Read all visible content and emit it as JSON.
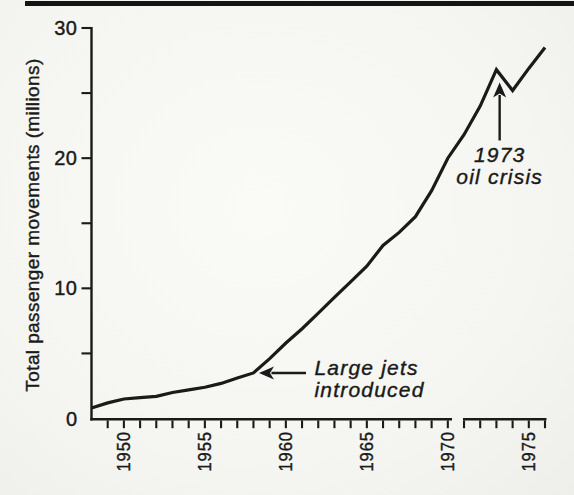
{
  "page": {
    "ink_color": "#1a1a1a",
    "paper_color": "#f5f5f1",
    "top_rule_color": "#141414"
  },
  "chart_data": {
    "type": "line",
    "title": "",
    "xlabel": "",
    "ylabel": "Total passenger movements (millions)",
    "x_range": [
      1948,
      1976
    ],
    "y_range": [
      0,
      30
    ],
    "x_labeled_ticks": [
      1950,
      1955,
      1960,
      1965,
      1970,
      1975
    ],
    "x_minor_tick_every": 1,
    "y_labeled_ticks": [
      0,
      10,
      20,
      30
    ],
    "y_minor_ticks": [
      5,
      15,
      25
    ],
    "grid": false,
    "legend_position": "none",
    "line_color": "#1a1a1a",
    "series": [
      {
        "name": "Total passenger movements",
        "points": [
          [
            1948,
            0.8
          ],
          [
            1949,
            1.2
          ],
          [
            1950,
            1.5
          ],
          [
            1951,
            1.6
          ],
          [
            1952,
            1.7
          ],
          [
            1953,
            2.0
          ],
          [
            1954,
            2.2
          ],
          [
            1955,
            2.4
          ],
          [
            1956,
            2.7
          ],
          [
            1957,
            3.1
          ],
          [
            1958,
            3.5
          ],
          [
            1959,
            4.6
          ],
          [
            1960,
            5.8
          ],
          [
            1961,
            6.9
          ],
          [
            1962,
            8.1
          ],
          [
            1963,
            9.3
          ],
          [
            1964,
            10.5
          ],
          [
            1965,
            11.7
          ],
          [
            1966,
            13.3
          ],
          [
            1967,
            14.3
          ],
          [
            1968,
            15.5
          ],
          [
            1969,
            17.5
          ],
          [
            1970,
            20.0
          ],
          [
            1971,
            21.8
          ],
          [
            1972,
            24.0
          ],
          [
            1973,
            26.8
          ],
          [
            1974,
            25.2
          ],
          [
            1975,
            26.9
          ],
          [
            1976,
            28.5
          ]
        ]
      }
    ],
    "annotations": [
      {
        "id": "large-jets-introduced",
        "lines": [
          "Large jets",
          "introduced"
        ],
        "arrow": "left",
        "target": {
          "year": 1958,
          "value": 3.5
        }
      },
      {
        "id": "oil-crisis-1973",
        "lines": [
          "1973",
          "oil crisis"
        ],
        "arrow": "up",
        "target": {
          "year": 1973.2,
          "value": 26.2
        }
      }
    ]
  }
}
